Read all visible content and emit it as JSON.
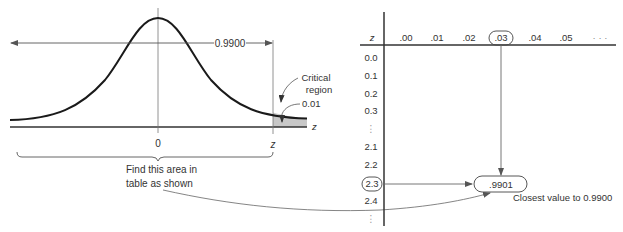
{
  "colors": {
    "curve": "#1a1a1a",
    "axis": "#333333",
    "guide": "#666666",
    "shade": "#c8c8c8",
    "text": "#333333"
  },
  "left_figure": {
    "area_label": "0.9900",
    "critical_region_line1": "Critical",
    "critical_region_line2": "region",
    "tail_area": "0.01",
    "axis_label": "z",
    "mean_label": "0",
    "z_label": "z",
    "brace_caption_line1": "Find this area in",
    "brace_caption_line2": "table as shown"
  },
  "table": {
    "corner_label": "z",
    "columns": [
      ".00",
      ".01",
      ".02",
      ".03",
      ".04",
      ".05",
      "· · ·"
    ],
    "highlighted_column": ".03",
    "rows": [
      "0.0",
      "0.1",
      "0.2",
      "0.3",
      "⋮",
      "2.1",
      "2.2",
      "2.3",
      "2.4",
      "⋮"
    ],
    "highlighted_row": "2.3",
    "found_value": ".9901",
    "found_value_note": "Closest value to 0.9900"
  }
}
